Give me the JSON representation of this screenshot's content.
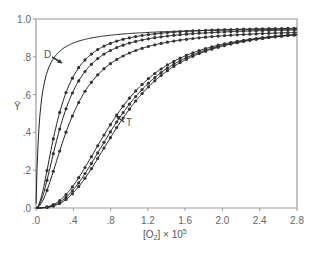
{
  "chart_data": {
    "type": "line",
    "title": "",
    "xlabel": "[O2] × 10^5",
    "ylabel": "Ȳ",
    "xlim": [
      0,
      2.8
    ],
    "ylim": [
      0,
      1.0
    ],
    "grid": false,
    "x_ticks": [
      ".0",
      ".4",
      ".8",
      "1.2",
      "1.6",
      "2.0",
      "2.4",
      "2.8"
    ],
    "y_ticks": [
      ".0",
      ".2",
      ".4",
      ".6",
      ".8",
      "1.0"
    ],
    "annotations": [
      {
        "text": "D",
        "x": 0.2,
        "y": 0.81
      },
      {
        "text": "T",
        "x": 0.95,
        "y": 0.46
      }
    ],
    "series": [
      {
        "name": "D",
        "kind": "line",
        "p50": 0.04,
        "n": 1.0,
        "ymax": 0.96
      },
      {
        "name": "curve-2",
        "kind": "line+markers",
        "p50": 0.24,
        "n": 1.9,
        "ymax": 0.96
      },
      {
        "name": "curve-3",
        "kind": "line+markers",
        "p50": 0.29,
        "n": 1.9,
        "ymax": 0.955
      },
      {
        "name": "curve-4",
        "kind": "line+markers",
        "p50": 0.38,
        "n": 1.9,
        "ymax": 0.95
      },
      {
        "name": "curve-5",
        "kind": "line+markers",
        "p50": 0.85,
        "n": 2.6,
        "ymax": 0.96
      },
      {
        "name": "curve-6",
        "kind": "line+markers",
        "p50": 0.9,
        "n": 2.7,
        "ymax": 0.96
      },
      {
        "name": "T",
        "kind": "line+markers",
        "p50": 0.94,
        "n": 2.8,
        "ymax": 0.96
      }
    ]
  },
  "labels": {
    "y_axis": "Ȳ",
    "x_axis_main": "[O",
    "x_axis_sub": "2",
    "x_axis_rest": "] × 10",
    "x_axis_sup": "5",
    "annot_D": "D",
    "annot_T": "T"
  }
}
